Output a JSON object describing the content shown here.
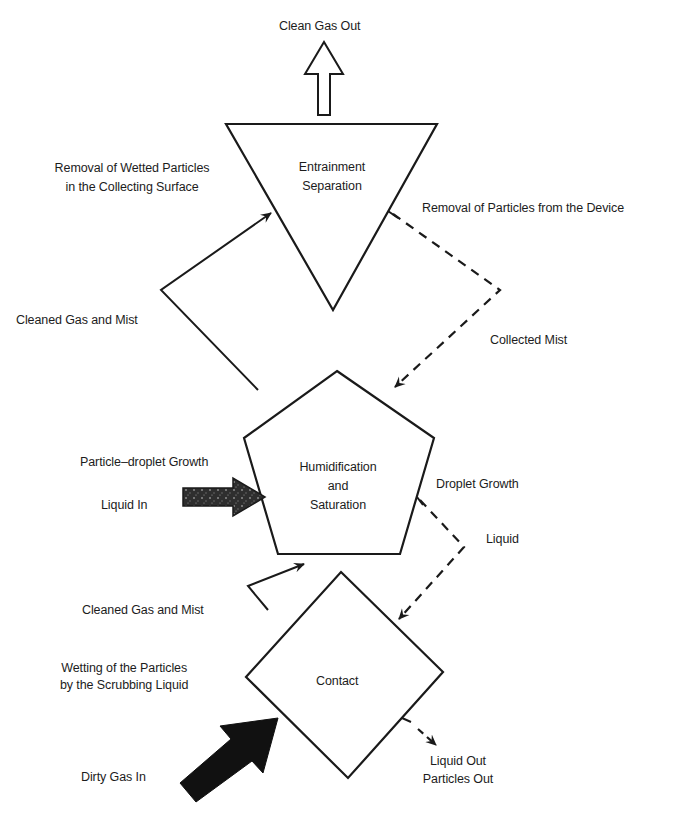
{
  "diagram": {
    "type": "process-flow",
    "nodes": [
      {
        "id": "entrainment",
        "shape": "inverted-triangle",
        "label_lines": [
          "Entrainment",
          "Separation"
        ]
      },
      {
        "id": "humidification",
        "shape": "pentagon",
        "label_lines": [
          "Humidification",
          "and",
          "Saturation"
        ]
      },
      {
        "id": "contact",
        "shape": "diamond",
        "label_lines": [
          "Contact"
        ]
      }
    ],
    "labels": {
      "clean_gas_out": "Clean Gas Out",
      "removal_wetted_line1": "Removal of Wetted Particles",
      "removal_wetted_line2": "in the Collecting Surface",
      "removal_device": "Removal of Particles from the Device",
      "cleaned_gas_mist_top": "Cleaned Gas and Mist",
      "collected_mist": "Collected Mist",
      "particle_droplet_growth": "Particle–droplet Growth",
      "liquid_in": "Liquid In",
      "droplet_growth": "Droplet Growth",
      "liquid": "Liquid",
      "cleaned_gas_mist_bottom": "Cleaned Gas and Mist",
      "wetting_line1": "Wetting of the Particles",
      "wetting_line2": "by the Scrubbing Liquid",
      "dirty_gas_in": "Dirty Gas In",
      "liquid_out": "Liquid Out",
      "particles_out": "Particles Out"
    },
    "edges": [
      {
        "from": "dirty_gas_in",
        "to": "contact",
        "style": "bold-filled-arrow"
      },
      {
        "from": "contact",
        "to": "humidification",
        "label": "Cleaned Gas and Mist",
        "style": "solid"
      },
      {
        "from": "liquid_in",
        "to": "humidification",
        "style": "shaded-arrow"
      },
      {
        "from": "humidification",
        "to": "entrainment",
        "label": "Cleaned Gas and Mist",
        "style": "solid"
      },
      {
        "from": "entrainment",
        "to": "clean_gas_out",
        "style": "hollow-arrow"
      },
      {
        "from": "entrainment",
        "to": "humidification",
        "label": "Collected Mist",
        "style": "dashed"
      },
      {
        "from": "humidification",
        "to": "contact",
        "label": "Liquid",
        "style": "dashed"
      },
      {
        "from": "contact",
        "to": "liquid_out",
        "style": "dashed"
      }
    ],
    "colors": {
      "stroke": "#1a1a1a",
      "background": "#ffffff",
      "liquid_arrow": "#3a3a3a"
    }
  }
}
